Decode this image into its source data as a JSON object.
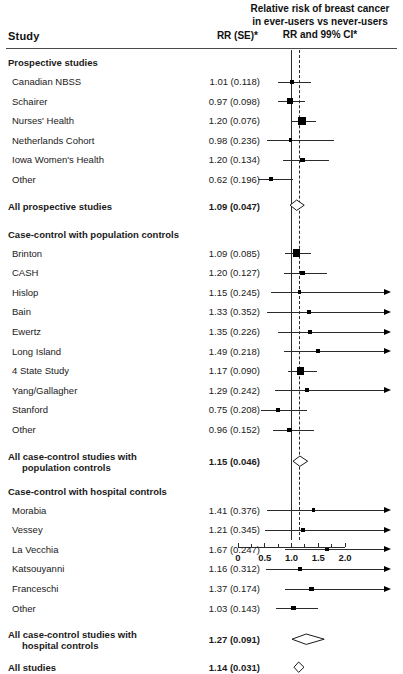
{
  "header": {
    "col_study": "Study",
    "col_rr": "RR (SE)*",
    "right_title_line1": "Relative risk of breast cancer",
    "right_title_line2": "in ever-users vs never-users",
    "right_title_line3": "RR and 99% CI*"
  },
  "axis": {
    "ticks": [
      "0",
      "0.5",
      "1.0",
      "1.5",
      "2.0"
    ],
    "tick_values": [
      0,
      0.5,
      1.0,
      1.5,
      2.0
    ],
    "minor_ticks": [
      0.25,
      0.75,
      1.25,
      1.75
    ],
    "min": 0,
    "max": 2.0,
    "null_value": 1.0,
    "pooled_ref": 1.14
  },
  "colors": {
    "ink": "#1a1a1a",
    "line": "#2b2b2b",
    "marker": "#000000",
    "background": "#ffffff"
  },
  "chart_data": {
    "type": "forest",
    "title": "Relative risk of breast cancer in ever-users vs never-users",
    "xlabel": "RR and 99% CI",
    "ylabel": "Study",
    "xlim": [
      0,
      2.0
    ],
    "null_line": 1.0,
    "pooled_line": 1.14,
    "ci_level": "99%",
    "grid": false,
    "legend": "none",
    "rows": [
      {
        "kind": "group",
        "label": "Prospective studies"
      },
      {
        "kind": "study",
        "label": "Canadian NBSS",
        "rr": 1.01,
        "se": 0.118,
        "value": "1.01 (0.118)",
        "lcl": 0.745,
        "ucl": 1.37,
        "weight": 2,
        "right_open": false
      },
      {
        "kind": "study",
        "label": "Schairer",
        "rr": 0.97,
        "se": 0.098,
        "value": "0.97 (0.098)",
        "lcl": 0.753,
        "ucl": 1.249,
        "weight": 3,
        "right_open": false
      },
      {
        "kind": "study",
        "label": "Nurses' Health",
        "rr": 1.2,
        "se": 0.076,
        "value": "1.20 (0.076)",
        "lcl": 0.987,
        "ucl": 1.459,
        "weight": 5,
        "right_open": false
      },
      {
        "kind": "study",
        "label": "Netherlands Cohort",
        "rr": 0.98,
        "se": 0.236,
        "value": "0.98 (0.236)",
        "lcl": 0.533,
        "ucl": 1.8,
        "weight": 1,
        "right_open": false
      },
      {
        "kind": "study",
        "label": "Iowa Women's Health",
        "rr": 1.2,
        "se": 0.134,
        "value": "1.20 (0.134)",
        "lcl": 0.85,
        "ucl": 1.694,
        "weight": 2,
        "right_open": false
      },
      {
        "kind": "study",
        "label": "Other",
        "rr": 0.62,
        "se": 0.196,
        "value": "0.62 (0.196)",
        "lcl": 0.374,
        "ucl": 1.028,
        "weight": 1,
        "right_open": false
      },
      {
        "kind": "summary",
        "label": "All prospective studies",
        "rr": 1.09,
        "se": 0.047,
        "value": "1.09 (0.047)",
        "lcl": 0.965,
        "ucl": 1.231
      },
      {
        "kind": "group",
        "label": "Case-control with population controls"
      },
      {
        "kind": "study",
        "label": "Brinton",
        "rr": 1.09,
        "se": 0.085,
        "value": "1.09 (0.085)",
        "lcl": 0.876,
        "ucl": 1.357,
        "weight": 4,
        "right_open": false
      },
      {
        "kind": "study",
        "label": "CASH",
        "rr": 1.2,
        "se": 0.127,
        "value": "1.20 (0.127)",
        "lcl": 0.866,
        "ucl": 1.663,
        "weight": 2,
        "right_open": false
      },
      {
        "kind": "study",
        "label": "Hislop",
        "rr": 1.15,
        "se": 0.245,
        "value": "1.15 (0.245)",
        "lcl": 0.612,
        "ucl": 2.161,
        "weight": 1,
        "right_open": true
      },
      {
        "kind": "study",
        "label": "Bain",
        "rr": 1.33,
        "se": 0.352,
        "value": "1.33 (0.352)",
        "lcl": 0.537,
        "ucl": 3.294,
        "weight": 1,
        "right_open": true
      },
      {
        "kind": "study",
        "label": "Ewertz",
        "rr": 1.35,
        "se": 0.226,
        "value": "1.35 (0.226)",
        "lcl": 0.755,
        "ucl": 2.415,
        "weight": 1,
        "right_open": true
      },
      {
        "kind": "study",
        "label": "Long Island",
        "rr": 1.49,
        "se": 0.218,
        "value": "1.49 (0.218)",
        "lcl": 0.851,
        "ucl": 2.608,
        "weight": 1,
        "right_open": true
      },
      {
        "kind": "study",
        "label": "4 State Study",
        "rr": 1.17,
        "se": 0.09,
        "value": "1.17 (0.090)",
        "lcl": 0.928,
        "ucl": 1.475,
        "weight": 4,
        "right_open": false
      },
      {
        "kind": "study",
        "label": "Yang/Gallagher",
        "rr": 1.29,
        "se": 0.242,
        "value": "1.29 (0.242)",
        "lcl": 0.691,
        "ucl": 2.406,
        "weight": 1,
        "right_open": true
      },
      {
        "kind": "study",
        "label": "Stanford",
        "rr": 0.75,
        "se": 0.208,
        "value": "0.75 (0.208)",
        "lcl": 0.439,
        "ucl": 1.281,
        "weight": 1,
        "right_open": false
      },
      {
        "kind": "study",
        "label": "Other",
        "rr": 0.96,
        "se": 0.152,
        "value": "0.96 (0.152)",
        "lcl": 0.649,
        "ucl": 1.42,
        "weight": 2,
        "right_open": false
      },
      {
        "kind": "summary",
        "label": "All case-control studies with",
        "label2": "population controls",
        "rr": 1.15,
        "se": 0.046,
        "value": "1.15 (0.046)",
        "lcl": 1.021,
        "ucl": 1.295
      },
      {
        "kind": "group",
        "label": "Case-control with hospital controls"
      },
      {
        "kind": "study",
        "label": "Morabia",
        "rr": 1.41,
        "se": 0.376,
        "value": "1.41 (0.376)",
        "lcl": 0.535,
        "ucl": 3.715,
        "weight": 1,
        "right_open": true
      },
      {
        "kind": "study",
        "label": "Vessey",
        "rr": 1.21,
        "se": 0.345,
        "value": "1.21 (0.345)",
        "lcl": 0.497,
        "ucl": 2.944,
        "weight": 1,
        "right_open": true
      },
      {
        "kind": "study",
        "label": "La Vecchia",
        "rr": 1.67,
        "se": 0.247,
        "value": "1.67 (0.247)",
        "lcl": 0.883,
        "ucl": 3.156,
        "weight": 1,
        "right_open": true
      },
      {
        "kind": "study",
        "label": "Katsouyanni",
        "rr": 1.16,
        "se": 0.312,
        "value": "1.16 (0.312)",
        "lcl": 0.519,
        "ucl": 2.591,
        "weight": 1,
        "right_open": true
      },
      {
        "kind": "study",
        "label": "Franceschi",
        "rr": 1.37,
        "se": 0.174,
        "value": "1.37 (0.174)",
        "lcl": 0.875,
        "ucl": 2.145,
        "weight": 2,
        "right_open": true
      },
      {
        "kind": "study",
        "label": "Other",
        "rr": 1.03,
        "se": 0.143,
        "value": "1.03 (0.143)",
        "lcl": 0.713,
        "ucl": 1.488,
        "weight": 2,
        "right_open": false
      },
      {
        "kind": "summary",
        "label": "All case-control studies with",
        "label2": "hospital controls",
        "rr": 1.27,
        "se": 0.091,
        "value": "1.27 (0.091)",
        "lcl": 1.004,
        "ucl": 1.606
      },
      {
        "kind": "summary",
        "label": "All studies",
        "rr": 1.14,
        "se": 0.031,
        "value": "1.14 (0.031)",
        "lcl": 1.053,
        "ucl": 1.235
      }
    ]
  }
}
